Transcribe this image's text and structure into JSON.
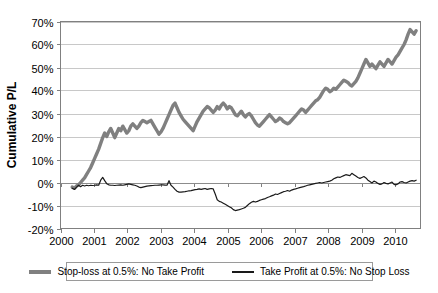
{
  "chart_data": {
    "type": "line",
    "title": "",
    "xlabel": "",
    "ylabel": "Cumulative P/L",
    "grid": true,
    "legend_position": "bottom",
    "xlim": [
      2000.0,
      2010.75
    ],
    "ylim": [
      -0.2,
      0.7
    ],
    "x_ticks": [
      "2000",
      "2001",
      "2002",
      "2003",
      "2004",
      "2005",
      "2006",
      "2007",
      "2008",
      "2009",
      "2010"
    ],
    "x_tick_values": [
      2000,
      2001,
      2002,
      2003,
      2004,
      2005,
      2006,
      2007,
      2008,
      2009,
      2010
    ],
    "y_ticks": [
      "-20%",
      "-10%",
      "0%",
      "10%",
      "20%",
      "30%",
      "40%",
      "50%",
      "60%",
      "70%"
    ],
    "y_tick_values": [
      -0.2,
      -0.1,
      0.0,
      0.1,
      0.2,
      0.3,
      0.4,
      0.5,
      0.6,
      0.7
    ],
    "colors": {
      "stop_loss_series": "#808080",
      "take_profit_series": "#1a1a1a",
      "grid": "#c8c8c8",
      "axis": "#808080",
      "background": "#ffffff"
    },
    "series": [
      {
        "name": "Stop-loss at 0.5%: No Take Profit",
        "color": "#808080",
        "width": 3.4,
        "x": [
          2000.35,
          2000.42,
          2000.48,
          2000.54,
          2000.6,
          2000.66,
          2000.72,
          2000.78,
          2000.84,
          2000.9,
          2000.96,
          2001.02,
          2001.08,
          2001.14,
          2001.2,
          2001.26,
          2001.32,
          2001.38,
          2001.44,
          2001.5,
          2001.56,
          2001.62,
          2001.68,
          2001.74,
          2001.8,
          2001.86,
          2001.92,
          2001.98,
          2002.04,
          2002.1,
          2002.16,
          2002.22,
          2002.28,
          2002.34,
          2002.4,
          2002.46,
          2002.52,
          2002.58,
          2002.64,
          2002.7,
          2002.76,
          2002.82,
          2002.88,
          2002.94,
          2003.0,
          2003.06,
          2003.12,
          2003.18,
          2003.24,
          2003.3,
          2003.36,
          2003.42,
          2003.48,
          2003.54,
          2003.6,
          2003.66,
          2003.72,
          2003.78,
          2003.84,
          2003.9,
          2003.96,
          2004.02,
          2004.08,
          2004.14,
          2004.2,
          2004.26,
          2004.32,
          2004.38,
          2004.44,
          2004.5,
          2004.56,
          2004.62,
          2004.68,
          2004.74,
          2004.8,
          2004.86,
          2004.92,
          2004.98,
          2005.04,
          2005.1,
          2005.16,
          2005.22,
          2005.28,
          2005.34,
          2005.4,
          2005.46,
          2005.52,
          2005.58,
          2005.64,
          2005.7,
          2005.76,
          2005.82,
          2005.88,
          2005.94,
          2006.0,
          2006.06,
          2006.12,
          2006.18,
          2006.24,
          2006.3,
          2006.36,
          2006.42,
          2006.48,
          2006.54,
          2006.6,
          2006.66,
          2006.72,
          2006.78,
          2006.84,
          2006.9,
          2006.96,
          2007.02,
          2007.08,
          2007.14,
          2007.2,
          2007.26,
          2007.32,
          2007.38,
          2007.44,
          2007.5,
          2007.56,
          2007.62,
          2007.68,
          2007.74,
          2007.8,
          2007.86,
          2007.92,
          2007.98,
          2008.04,
          2008.1,
          2008.16,
          2008.22,
          2008.28,
          2008.34,
          2008.4,
          2008.46,
          2008.52,
          2008.58,
          2008.64,
          2008.7,
          2008.76,
          2008.82,
          2008.88,
          2008.94,
          2009.0,
          2009.06,
          2009.12,
          2009.18,
          2009.24,
          2009.3,
          2009.36,
          2009.42,
          2009.48,
          2009.54,
          2009.6,
          2009.66,
          2009.72,
          2009.78,
          2009.84,
          2009.9,
          2009.96,
          2010.02,
          2010.08,
          2010.14,
          2010.2,
          2010.26,
          2010.32,
          2010.38,
          2010.44,
          2010.5,
          2010.56,
          2010.62
        ],
        "y": [
          -0.02,
          -0.025,
          -0.015,
          -0.01,
          0.0,
          0.01,
          0.02,
          0.035,
          0.05,
          0.065,
          0.085,
          0.105,
          0.125,
          0.145,
          0.17,
          0.195,
          0.215,
          0.2,
          0.22,
          0.235,
          0.215,
          0.195,
          0.215,
          0.235,
          0.225,
          0.245,
          0.23,
          0.215,
          0.225,
          0.245,
          0.255,
          0.245,
          0.235,
          0.245,
          0.26,
          0.27,
          0.265,
          0.26,
          0.265,
          0.27,
          0.255,
          0.24,
          0.225,
          0.21,
          0.22,
          0.235,
          0.255,
          0.275,
          0.295,
          0.315,
          0.335,
          0.345,
          0.325,
          0.305,
          0.29,
          0.275,
          0.265,
          0.255,
          0.245,
          0.235,
          0.225,
          0.245,
          0.265,
          0.28,
          0.295,
          0.31,
          0.32,
          0.33,
          0.325,
          0.315,
          0.305,
          0.315,
          0.33,
          0.32,
          0.335,
          0.345,
          0.335,
          0.32,
          0.33,
          0.325,
          0.31,
          0.295,
          0.29,
          0.3,
          0.31,
          0.295,
          0.285,
          0.295,
          0.3,
          0.29,
          0.275,
          0.26,
          0.25,
          0.245,
          0.255,
          0.265,
          0.275,
          0.285,
          0.295,
          0.285,
          0.275,
          0.265,
          0.27,
          0.28,
          0.275,
          0.265,
          0.26,
          0.255,
          0.26,
          0.27,
          0.28,
          0.29,
          0.3,
          0.31,
          0.32,
          0.315,
          0.305,
          0.315,
          0.325,
          0.335,
          0.345,
          0.355,
          0.36,
          0.37,
          0.385,
          0.4,
          0.41,
          0.405,
          0.395,
          0.4,
          0.41,
          0.405,
          0.415,
          0.425,
          0.435,
          0.445,
          0.44,
          0.435,
          0.425,
          0.42,
          0.43,
          0.44,
          0.455,
          0.475,
          0.495,
          0.515,
          0.535,
          0.52,
          0.505,
          0.515,
          0.505,
          0.495,
          0.51,
          0.525,
          0.515,
          0.505,
          0.52,
          0.535,
          0.525,
          0.515,
          0.53,
          0.545,
          0.555,
          0.57,
          0.585,
          0.6,
          0.62,
          0.645,
          0.665,
          0.655,
          0.645,
          0.66
        ]
      },
      {
        "name": "Take Profit at 0.5%: No Stop Loss",
        "color": "#1a1a1a",
        "width": 1.2,
        "x": [
          2000.35,
          2000.42,
          2000.48,
          2000.54,
          2000.6,
          2000.66,
          2000.72,
          2000.78,
          2000.84,
          2000.9,
          2000.96,
          2001.02,
          2001.08,
          2001.14,
          2001.2,
          2001.26,
          2001.32,
          2001.38,
          2001.44,
          2001.5,
          2001.56,
          2001.62,
          2001.68,
          2001.74,
          2001.8,
          2001.86,
          2001.92,
          2001.98,
          2002.04,
          2002.1,
          2002.16,
          2002.22,
          2002.28,
          2002.34,
          2002.4,
          2002.46,
          2002.52,
          2002.58,
          2002.64,
          2002.7,
          2002.76,
          2002.82,
          2002.88,
          2002.94,
          2003.0,
          2003.06,
          2003.12,
          2003.18,
          2003.24,
          2003.3,
          2003.36,
          2003.42,
          2003.48,
          2003.54,
          2003.6,
          2003.66,
          2003.72,
          2003.78,
          2003.84,
          2003.9,
          2003.96,
          2004.02,
          2004.08,
          2004.14,
          2004.2,
          2004.26,
          2004.32,
          2004.38,
          2004.44,
          2004.5,
          2004.56,
          2004.62,
          2004.68,
          2004.74,
          2004.8,
          2004.86,
          2004.92,
          2004.98,
          2005.04,
          2005.1,
          2005.16,
          2005.22,
          2005.28,
          2005.34,
          2005.4,
          2005.46,
          2005.52,
          2005.58,
          2005.64,
          2005.7,
          2005.76,
          2005.82,
          2005.88,
          2005.94,
          2006.0,
          2006.06,
          2006.12,
          2006.18,
          2006.24,
          2006.3,
          2006.36,
          2006.42,
          2006.48,
          2006.54,
          2006.6,
          2006.66,
          2006.72,
          2006.78,
          2006.84,
          2006.9,
          2006.96,
          2007.02,
          2007.08,
          2007.14,
          2007.2,
          2007.26,
          2007.32,
          2007.38,
          2007.44,
          2007.5,
          2007.56,
          2007.62,
          2007.68,
          2007.74,
          2007.8,
          2007.86,
          2007.92,
          2007.98,
          2008.04,
          2008.1,
          2008.16,
          2008.22,
          2008.28,
          2008.34,
          2008.4,
          2008.46,
          2008.52,
          2008.58,
          2008.64,
          2008.7,
          2008.76,
          2008.82,
          2008.88,
          2008.94,
          2009.0,
          2009.06,
          2009.12,
          2009.18,
          2009.24,
          2009.3,
          2009.36,
          2009.42,
          2009.48,
          2009.54,
          2009.6,
          2009.66,
          2009.72,
          2009.78,
          2009.84,
          2009.9,
          2009.96,
          2010.02,
          2010.08,
          2010.14,
          2010.2,
          2010.26,
          2010.32,
          2010.38,
          2010.44,
          2010.5,
          2010.56,
          2010.62
        ],
        "y": [
          -0.025,
          -0.03,
          -0.02,
          -0.012,
          -0.018,
          -0.012,
          -0.015,
          -0.012,
          -0.014,
          -0.012,
          -0.013,
          -0.012,
          -0.01,
          -0.012,
          0.01,
          0.022,
          0.008,
          -0.005,
          -0.01,
          -0.012,
          -0.012,
          -0.013,
          -0.012,
          -0.011,
          -0.01,
          -0.012,
          -0.01,
          -0.008,
          -0.006,
          -0.008,
          -0.01,
          -0.012,
          -0.015,
          -0.02,
          -0.022,
          -0.02,
          -0.018,
          -0.016,
          -0.015,
          -0.014,
          -0.013,
          -0.012,
          -0.012,
          -0.011,
          -0.01,
          -0.01,
          -0.011,
          -0.012,
          0.008,
          -0.012,
          -0.02,
          -0.03,
          -0.038,
          -0.042,
          -0.042,
          -0.041,
          -0.04,
          -0.038,
          -0.036,
          -0.035,
          -0.033,
          -0.031,
          -0.03,
          -0.028,
          -0.03,
          -0.028,
          -0.026,
          -0.03,
          -0.028,
          -0.026,
          -0.028,
          -0.05,
          -0.075,
          -0.082,
          -0.085,
          -0.09,
          -0.095,
          -0.1,
          -0.105,
          -0.11,
          -0.118,
          -0.122,
          -0.12,
          -0.118,
          -0.115,
          -0.112,
          -0.108,
          -0.1,
          -0.092,
          -0.086,
          -0.082,
          -0.085,
          -0.082,
          -0.078,
          -0.075,
          -0.072,
          -0.07,
          -0.065,
          -0.062,
          -0.058,
          -0.055,
          -0.05,
          -0.052,
          -0.048,
          -0.044,
          -0.04,
          -0.038,
          -0.035,
          -0.038,
          -0.033,
          -0.03,
          -0.028,
          -0.025,
          -0.022,
          -0.02,
          -0.018,
          -0.015,
          -0.012,
          -0.01,
          -0.008,
          -0.006,
          -0.004,
          -0.002,
          0.0,
          -0.002,
          0.0,
          0.002,
          0.004,
          0.006,
          0.01,
          0.016,
          0.02,
          0.024,
          0.022,
          0.026,
          0.03,
          0.034,
          0.032,
          0.03,
          0.04,
          0.034,
          0.028,
          0.022,
          0.018,
          0.022,
          0.026,
          0.02,
          0.01,
          0.004,
          -0.002,
          0.006,
          0.002,
          -0.004,
          -0.008,
          -0.006,
          0.0,
          -0.004,
          -0.006,
          -0.002,
          0.002,
          -0.008,
          -0.01,
          -0.006,
          0.002,
          0.004,
          0.0,
          -0.002,
          0.002,
          0.006,
          0.008,
          0.006,
          0.01
        ]
      }
    ]
  },
  "legend": {
    "entries": [
      {
        "label": "Stop-loss at 0.5%: No Take Profit",
        "color": "#808080",
        "thickness": 4
      },
      {
        "label": "Take Profit at 0.5%: No Stop Loss",
        "color": "#1a1a1a",
        "thickness": 2
      }
    ]
  }
}
